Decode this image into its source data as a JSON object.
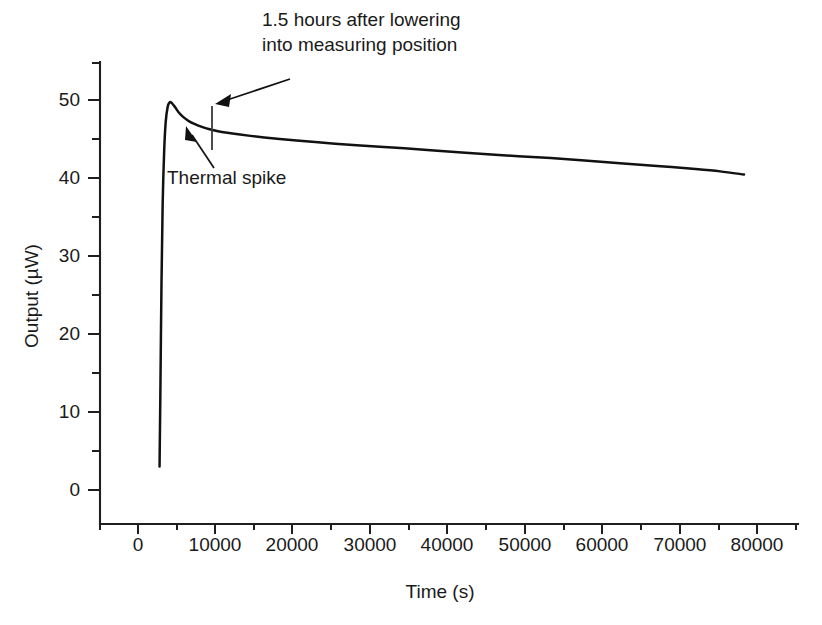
{
  "chart_data": {
    "type": "line",
    "title": "",
    "xlabel": "Time (s)",
    "ylabel": "Output (µW)",
    "xlim": [
      -3500,
      86000
    ],
    "ylim": [
      -5,
      56
    ],
    "grid": false,
    "legend": "none",
    "xticks": [
      0,
      10000,
      20000,
      30000,
      40000,
      50000,
      60000,
      70000,
      80000
    ],
    "xtick_labels": [
      "0",
      "10000",
      "20000",
      "30000",
      "40000",
      "50000",
      "60000",
      "70000",
      "80000"
    ],
    "xminor_ticks": [
      -5000,
      5000,
      15000,
      25000,
      35000,
      45000,
      55000,
      65000,
      75000,
      85000
    ],
    "yticks": [
      0,
      10,
      20,
      30,
      40,
      50
    ],
    "ytick_labels": [
      "0",
      "10",
      "20",
      "30",
      "40",
      "50"
    ],
    "yminor_ticks": [
      5,
      15,
      25,
      35,
      45,
      55
    ],
    "series": [
      {
        "name": "Output",
        "x": [
          2800,
          2900,
          3050,
          3200,
          3400,
          3600,
          3850,
          4100,
          4400,
          4800,
          5300,
          5900,
          6600,
          7400,
          8300,
          9300,
          10400,
          11600,
          13000,
          14600,
          16400,
          18400,
          20600,
          23000,
          25600,
          28400,
          31400,
          34600,
          38000,
          41600,
          45400,
          49400,
          53600,
          58000,
          62600,
          67400,
          72400,
          75600,
          78700
        ],
        "y": [
          3.0,
          12.0,
          26.5,
          36.5,
          43.5,
          47.2,
          49.1,
          49.7,
          49.6,
          49.1,
          48.4,
          47.8,
          47.3,
          46.9,
          46.55,
          46.25,
          46.0,
          45.8,
          45.6,
          45.4,
          45.2,
          45.0,
          44.8,
          44.6,
          44.4,
          44.2,
          44.0,
          43.8,
          43.55,
          43.3,
          43.05,
          42.8,
          42.55,
          42.25,
          41.9,
          41.55,
          41.15,
          40.85,
          40.45
        ]
      }
    ],
    "annotations": [
      {
        "name": "lowering-annotation",
        "text_line1": "1.5 hours after lowering",
        "text_line2": "into measuring position",
        "points_to_x": 10000,
        "points_to_y": 50.5
      },
      {
        "name": "thermal-spike-annotation",
        "text": "Thermal spike",
        "points_to_x": 4600,
        "points_to_y": 47.0
      }
    ],
    "markers": [
      {
        "name": "lowering-time-marker",
        "x": 9650,
        "y_from": 48.5,
        "y_to": 42.8
      }
    ]
  }
}
